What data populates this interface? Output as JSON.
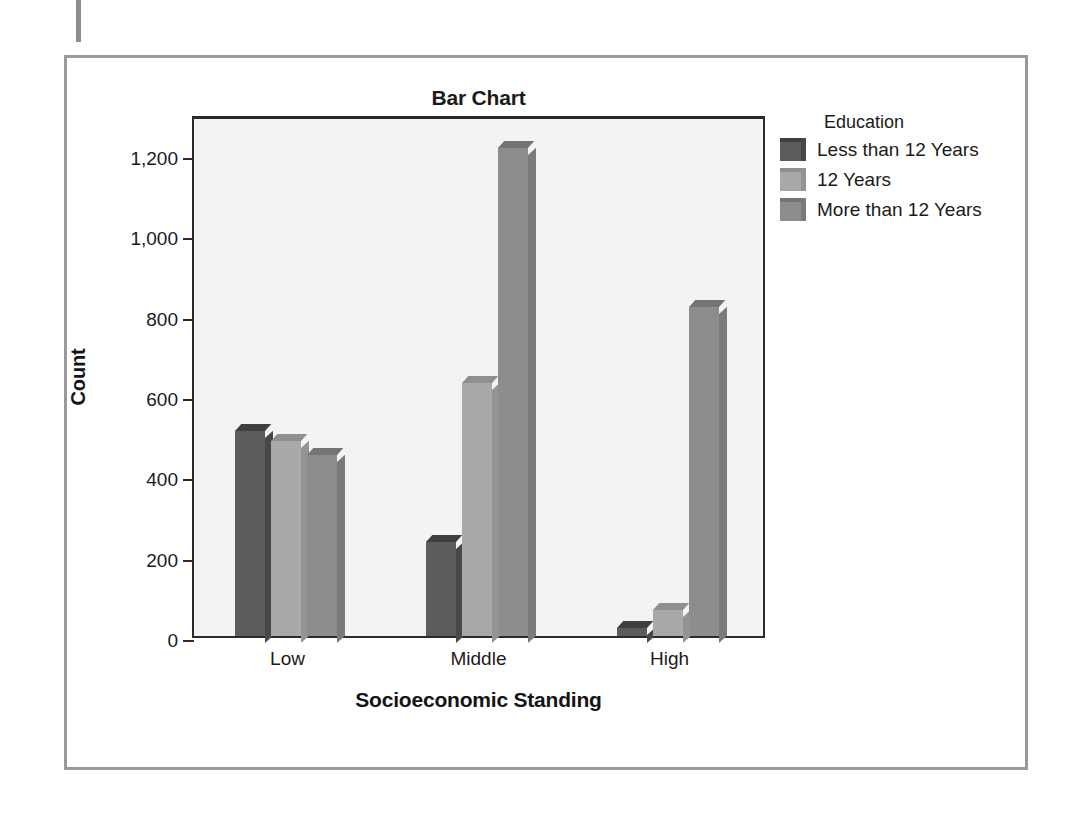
{
  "figure": {
    "title": "Bar Chart"
  },
  "legend": {
    "title": "Education",
    "entries": [
      {
        "label": "Less than 12 Years",
        "color": "#5c5c5c",
        "top_color": "#3f3f3f",
        "side_color": "#474747"
      },
      {
        "label": "12 Years",
        "color": "#a9a9a9",
        "top_color": "#8f8f8f",
        "side_color": "#949494"
      },
      {
        "label": "More than 12 Years",
        "color": "#8d8d8d",
        "top_color": "#747474",
        "side_color": "#7a7a7a"
      }
    ]
  },
  "axes": {
    "y_title": "Count",
    "x_title": "Socioeconomic Standing",
    "y_ticks": [
      "0",
      "200",
      "400",
      "600",
      "800",
      "1,000",
      "1,200"
    ],
    "y_tick_values": [
      0,
      200,
      400,
      600,
      800,
      1000,
      1200
    ],
    "x_ticks": [
      "Low",
      "Middle",
      "High"
    ]
  },
  "chart_data": {
    "type": "bar",
    "title": "Bar Chart",
    "xlabel": "Socioeconomic Standing",
    "ylabel": "Count",
    "categories": [
      "Low",
      "Middle",
      "High"
    ],
    "legend_title": "Education",
    "legend_position": "right",
    "grid": false,
    "ylim": [
      0,
      1300
    ],
    "yticks": [
      0,
      200,
      400,
      600,
      800,
      1000,
      1200
    ],
    "ytick_labels": [
      "0",
      "200",
      "400",
      "600",
      "800",
      "1,000",
      "1,200"
    ],
    "series": [
      {
        "name": "Less than 12 Years",
        "color": "#5c5c5c",
        "values": [
          510,
          235,
          20
        ]
      },
      {
        "name": "12 Years",
        "color": "#a9a9a9",
        "values": [
          485,
          630,
          65
        ]
      },
      {
        "name": "More than 12 Years",
        "color": "#8d8d8d",
        "values": [
          450,
          1215,
          820
        ]
      }
    ]
  }
}
